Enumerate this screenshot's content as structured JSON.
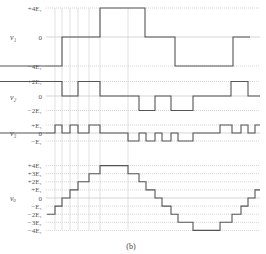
{
  "caption": "(b)",
  "colors": {
    "wave": "#555555",
    "grid": "#bbbbbb",
    "guide": "#cccccc"
  },
  "panels": [
    {
      "name": "v1",
      "ylabel": "v₁",
      "levels": [
        {
          "label": "+4E₁",
          "value": 4
        },
        {
          "label": "0",
          "value": 0
        },
        {
          "label": "−4E₁",
          "value": -4
        }
      ],
      "waveform": [
        [
          0,
          -4
        ],
        [
          62,
          -4
        ],
        [
          62,
          0
        ],
        [
          100,
          0
        ],
        [
          100,
          4
        ],
        [
          145,
          4
        ],
        [
          145,
          0
        ],
        [
          175,
          0
        ],
        [
          175,
          -4
        ],
        [
          233,
          -4
        ],
        [
          233,
          0
        ],
        [
          250,
          0
        ]
      ]
    },
    {
      "name": "v2",
      "ylabel": "v₂",
      "levels": [
        {
          "label": "+2E₁",
          "value": 2
        },
        {
          "label": "0",
          "value": 0
        },
        {
          "label": "−2E₁",
          "value": -2
        }
      ],
      "waveform": [
        [
          0,
          2
        ],
        [
          62,
          2
        ],
        [
          62,
          0
        ],
        [
          78,
          0
        ],
        [
          78,
          2
        ],
        [
          100,
          2
        ],
        [
          100,
          0
        ],
        [
          139,
          0
        ],
        [
          139,
          -2
        ],
        [
          155,
          -2
        ],
        [
          155,
          0
        ],
        [
          171,
          0
        ],
        [
          171,
          -2
        ],
        [
          193,
          -2
        ],
        [
          193,
          0
        ],
        [
          231,
          0
        ],
        [
          231,
          2
        ],
        [
          248,
          2
        ],
        [
          248,
          0
        ],
        [
          260,
          0
        ]
      ]
    },
    {
      "name": "v3",
      "ylabel": "v₃",
      "levels": [
        {
          "label": "+E₁",
          "value": 1
        },
        {
          "label": "0",
          "value": 0
        },
        {
          "label": "−E₁",
          "value": -1
        }
      ],
      "waveform": [
        [
          0,
          0
        ],
        [
          55,
          0
        ],
        [
          55,
          1
        ],
        [
          62,
          1
        ],
        [
          62,
          0
        ],
        [
          70,
          0
        ],
        [
          70,
          1
        ],
        [
          78,
          1
        ],
        [
          78,
          0
        ],
        [
          89,
          0
        ],
        [
          89,
          1
        ],
        [
          100,
          1
        ],
        [
          100,
          0
        ],
        [
          128,
          0
        ],
        [
          128,
          -1
        ],
        [
          139,
          -1
        ],
        [
          139,
          0
        ],
        [
          146,
          0
        ],
        [
          146,
          -1
        ],
        [
          155,
          -1
        ],
        [
          155,
          0
        ],
        [
          162,
          0
        ],
        [
          162,
          -1
        ],
        [
          171,
          -1
        ],
        [
          171,
          0
        ],
        [
          178,
          0
        ],
        [
          178,
          -1
        ],
        [
          193,
          -1
        ],
        [
          193,
          0
        ],
        [
          220,
          0
        ],
        [
          220,
          1
        ],
        [
          232,
          1
        ],
        [
          232,
          0
        ],
        [
          241,
          0
        ],
        [
          241,
          1
        ],
        [
          248,
          1
        ],
        [
          248,
          0
        ],
        [
          255,
          0
        ],
        [
          255,
          1
        ],
        [
          260,
          1
        ]
      ]
    },
    {
      "name": "vo",
      "ylabel": "vₒ",
      "levels": [
        {
          "label": "+4E₁",
          "value": 4
        },
        {
          "label": "+3E₁",
          "value": 3
        },
        {
          "label": "+2E₁",
          "value": 2
        },
        {
          "label": "+E₁",
          "value": 1
        },
        {
          "label": "0",
          "value": 0
        },
        {
          "label": "−E₁",
          "value": -1
        },
        {
          "label": "−2E₁",
          "value": -2
        },
        {
          "label": "−3E₁",
          "value": -3
        },
        {
          "label": "−4E₁",
          "value": -4
        }
      ],
      "waveform": [
        [
          47,
          -2
        ],
        [
          55,
          -2
        ],
        [
          55,
          -1
        ],
        [
          62,
          -1
        ],
        [
          62,
          0
        ],
        [
          70,
          0
        ],
        [
          70,
          1
        ],
        [
          78,
          1
        ],
        [
          78,
          2
        ],
        [
          89,
          2
        ],
        [
          89,
          3
        ],
        [
          100,
          3
        ],
        [
          100,
          4
        ],
        [
          128,
          4
        ],
        [
          128,
          3
        ],
        [
          139,
          3
        ],
        [
          139,
          2
        ],
        [
          146,
          2
        ],
        [
          146,
          1
        ],
        [
          155,
          1
        ],
        [
          155,
          0
        ],
        [
          162,
          0
        ],
        [
          162,
          -1
        ],
        [
          171,
          -1
        ],
        [
          171,
          -2
        ],
        [
          178,
          -2
        ],
        [
          178,
          -3
        ],
        [
          193,
          -3
        ],
        [
          193,
          -4
        ],
        [
          220,
          -4
        ],
        [
          220,
          -3
        ],
        [
          232,
          -3
        ],
        [
          232,
          -2
        ],
        [
          241,
          -2
        ],
        [
          241,
          -1
        ],
        [
          248,
          -1
        ],
        [
          248,
          0
        ],
        [
          255,
          0
        ],
        [
          255,
          1
        ],
        [
          260,
          1
        ]
      ]
    }
  ],
  "guides": [
    55,
    62,
    70,
    78,
    89,
    100,
    128
  ]
}
